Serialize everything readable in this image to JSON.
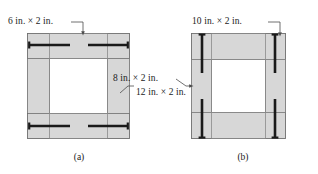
{
  "figure": {
    "background_color": "#ffffff",
    "member_fill_color": "#d7d7d7",
    "member_edge_color": "#6e6e6e",
    "bolt_color": "#1a1a1a",
    "leader_color": "#4d4d4d",
    "text_color": "#1a1a1a"
  },
  "panels": [
    {
      "id": "a",
      "caption": "(a)",
      "labels": [
        {
          "key": "top_member",
          "text": "6 in. × 2 in."
        },
        {
          "key": "side_member",
          "text": "12 in. × 2 in."
        }
      ],
      "bolt_orientation": "horizontal",
      "bolt_count": 4
    },
    {
      "id": "b",
      "caption": "(b)",
      "labels": [
        {
          "key": "top_member",
          "text": "10 in. × 2 in."
        },
        {
          "key": "side_member",
          "text": "8 in. × 2 in."
        }
      ],
      "bolt_orientation": "vertical",
      "bolt_count": 4
    }
  ],
  "annotations": {
    "label_a_top": "6 in. × 2 in.",
    "label_a_side": "12 in. × 2 in.",
    "label_b_top": "10 in. × 2 in.",
    "label_b_side": "8 in. × 2 in.",
    "caption_a": "(a)",
    "caption_b": "(b)"
  }
}
